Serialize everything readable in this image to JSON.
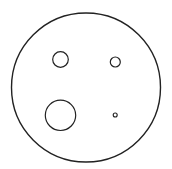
{
  "canvas": {
    "width": 172,
    "height": 169,
    "background": "#ffffff"
  },
  "style": {
    "stroke_color": "#222222",
    "fill": "none"
  },
  "shapes": [
    {
      "id": "outer-circle",
      "cx": 86,
      "cy": 87.5,
      "r": 74.5,
      "stroke_width": 1.4
    },
    {
      "id": "circle-top-left",
      "cx": 60.5,
      "cy": 59.5,
      "r": 7.8,
      "stroke_width": 1.2
    },
    {
      "id": "circle-top-right",
      "cx": 115.3,
      "cy": 62,
      "r": 5,
      "stroke_width": 1.2
    },
    {
      "id": "circle-bottom-left",
      "cx": 60.5,
      "cy": 115.3,
      "r": 15.2,
      "stroke_width": 1.2
    },
    {
      "id": "circle-bottom-right",
      "cx": 115.2,
      "cy": 115,
      "r": 2,
      "stroke_width": 1.1
    }
  ]
}
